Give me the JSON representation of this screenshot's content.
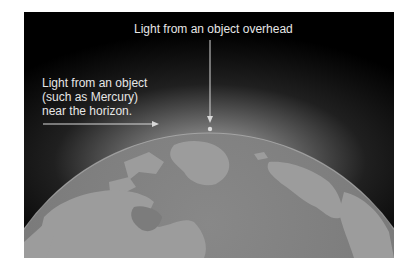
{
  "figure": {
    "labels": {
      "overhead": "Light from an object overhead",
      "horizon_lines": [
        "Light from an object",
        "(such as Mercury)",
        "near the horizon."
      ]
    },
    "icons": {
      "overhead_arrow": "arrow-down-icon",
      "horizon_arrow": "arrow-right-icon",
      "observer_point": "dot-icon"
    },
    "colors": {
      "background": "#000000",
      "land": "#9c9c9c",
      "ocean": "#7c7c7c",
      "text": "#e6e6e6",
      "arrow": "#d8d8d8"
    }
  }
}
